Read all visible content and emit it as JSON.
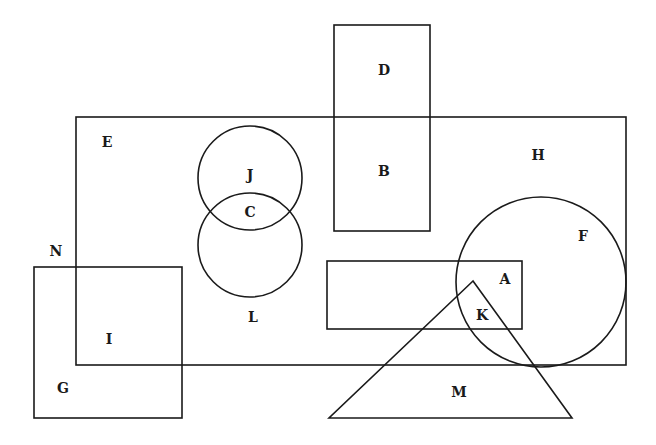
{
  "diagram": {
    "type": "set-region-diagram",
    "shapes": [
      {
        "id": "big-rectangle",
        "kind": "rect",
        "x": 76,
        "y": 117,
        "w": 550,
        "h": 248
      },
      {
        "id": "tall-rectangle",
        "kind": "rect",
        "x": 334,
        "y": 25,
        "w": 96,
        "h": 206
      },
      {
        "id": "circle-upper",
        "kind": "circle",
        "cx": 250,
        "cy": 178,
        "r": 52
      },
      {
        "id": "circle-lower",
        "kind": "circle",
        "cx": 250,
        "cy": 245,
        "r": 52
      },
      {
        "id": "circle-right",
        "kind": "circle",
        "cx": 541,
        "cy": 282,
        "r": 85
      },
      {
        "id": "wide-rectangle",
        "kind": "rect",
        "x": 327,
        "y": 261,
        "w": 195,
        "h": 68
      },
      {
        "id": "triangle",
        "kind": "polygon",
        "points": "473,281 329,418 572,418"
      },
      {
        "id": "square",
        "kind": "rect",
        "x": 34,
        "y": 267,
        "w": 148,
        "h": 151
      }
    ],
    "labels": [
      {
        "text": "A",
        "x": 505,
        "y": 279
      },
      {
        "text": "B",
        "x": 384,
        "y": 171
      },
      {
        "text": "C",
        "x": 250,
        "y": 212
      },
      {
        "text": "D",
        "x": 384,
        "y": 70
      },
      {
        "text": "E",
        "x": 107,
        "y": 142
      },
      {
        "text": "F",
        "x": 583,
        "y": 236
      },
      {
        "text": "G",
        "x": 63,
        "y": 388
      },
      {
        "text": "H",
        "x": 538,
        "y": 155
      },
      {
        "text": "I",
        "x": 109,
        "y": 339
      },
      {
        "text": "J",
        "x": 250,
        "y": 175
      },
      {
        "text": "K",
        "x": 482,
        "y": 315
      },
      {
        "text": "L",
        "x": 253,
        "y": 317
      },
      {
        "text": "M",
        "x": 459,
        "y": 392
      },
      {
        "text": "N",
        "x": 56,
        "y": 251
      }
    ]
  }
}
